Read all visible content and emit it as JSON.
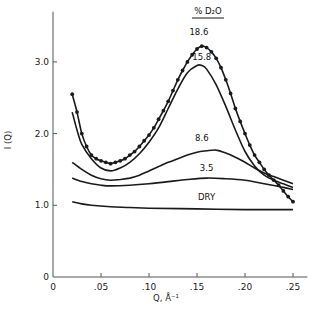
{
  "chart_data": {
    "type": "line",
    "title": "",
    "xlabel": "Q, Å⁻¹",
    "ylabel": "I (Q)",
    "xlim": [
      0,
      0.265
    ],
    "ylim": [
      0,
      3.7
    ],
    "grid": false,
    "legend": {
      "title": "% D2O",
      "position": "curve-labels"
    },
    "x_ticks": [
      {
        "value": 0,
        "label": "0"
      },
      {
        "value": 0.05,
        "label": ".05"
      },
      {
        "value": 0.1,
        "label": ".10"
      },
      {
        "value": 0.15,
        "label": ".15"
      },
      {
        "value": 0.2,
        "label": ".20"
      },
      {
        "value": 0.25,
        "label": ".25"
      }
    ],
    "y_ticks": [
      {
        "value": 0,
        "label": "0"
      },
      {
        "value": 1.0,
        "label": "1.0"
      },
      {
        "value": 2.0,
        "label": "2.0"
      },
      {
        "value": 3.0,
        "label": "3.0"
      }
    ],
    "series": [
      {
        "name": "18.6",
        "style": "line+markers",
        "label_pos": [
          0.152,
          3.38
        ],
        "points": [
          [
            0.02,
            2.55
          ],
          [
            0.025,
            2.3
          ],
          [
            0.03,
            2.0
          ],
          [
            0.035,
            1.82
          ],
          [
            0.04,
            1.7
          ],
          [
            0.045,
            1.65
          ],
          [
            0.05,
            1.62
          ],
          [
            0.055,
            1.6
          ],
          [
            0.06,
            1.58
          ],
          [
            0.065,
            1.6
          ],
          [
            0.07,
            1.62
          ],
          [
            0.075,
            1.65
          ],
          [
            0.08,
            1.7
          ],
          [
            0.085,
            1.75
          ],
          [
            0.09,
            1.82
          ],
          [
            0.095,
            1.9
          ],
          [
            0.1,
            1.98
          ],
          [
            0.105,
            2.08
          ],
          [
            0.11,
            2.2
          ],
          [
            0.115,
            2.32
          ],
          [
            0.12,
            2.45
          ],
          [
            0.125,
            2.6
          ],
          [
            0.13,
            2.75
          ],
          [
            0.135,
            2.88
          ],
          [
            0.14,
            3.0
          ],
          [
            0.145,
            3.1
          ],
          [
            0.15,
            3.18
          ],
          [
            0.155,
            3.22
          ],
          [
            0.16,
            3.2
          ],
          [
            0.165,
            3.14
          ],
          [
            0.17,
            3.05
          ],
          [
            0.175,
            2.92
          ],
          [
            0.18,
            2.75
          ],
          [
            0.185,
            2.56
          ],
          [
            0.19,
            2.35
          ],
          [
            0.195,
            2.17
          ],
          [
            0.2,
            2.0
          ],
          [
            0.205,
            1.84
          ],
          [
            0.21,
            1.7
          ],
          [
            0.215,
            1.6
          ],
          [
            0.22,
            1.5
          ],
          [
            0.225,
            1.42
          ],
          [
            0.23,
            1.35
          ],
          [
            0.235,
            1.28
          ],
          [
            0.24,
            1.2
          ],
          [
            0.245,
            1.12
          ],
          [
            0.25,
            1.05
          ]
        ]
      },
      {
        "name": "15.8",
        "style": "line",
        "label_pos": [
          0.155,
          3.03
        ],
        "points": [
          [
            0.02,
            2.3
          ],
          [
            0.025,
            2.05
          ],
          [
            0.03,
            1.85
          ],
          [
            0.04,
            1.65
          ],
          [
            0.05,
            1.52
          ],
          [
            0.06,
            1.48
          ],
          [
            0.07,
            1.52
          ],
          [
            0.08,
            1.6
          ],
          [
            0.09,
            1.72
          ],
          [
            0.1,
            1.88
          ],
          [
            0.11,
            2.08
          ],
          [
            0.12,
            2.35
          ],
          [
            0.13,
            2.62
          ],
          [
            0.14,
            2.85
          ],
          [
            0.15,
            2.95
          ],
          [
            0.155,
            2.95
          ],
          [
            0.16,
            2.9
          ],
          [
            0.17,
            2.68
          ],
          [
            0.18,
            2.38
          ],
          [
            0.19,
            2.05
          ],
          [
            0.2,
            1.75
          ],
          [
            0.21,
            1.55
          ],
          [
            0.22,
            1.42
          ],
          [
            0.23,
            1.35
          ],
          [
            0.24,
            1.3
          ],
          [
            0.25,
            1.25
          ]
        ]
      },
      {
        "name": "8.6",
        "style": "line",
        "label_pos": [
          0.155,
          1.9
        ],
        "points": [
          [
            0.02,
            1.6
          ],
          [
            0.03,
            1.5
          ],
          [
            0.04,
            1.42
          ],
          [
            0.05,
            1.37
          ],
          [
            0.06,
            1.35
          ],
          [
            0.07,
            1.36
          ],
          [
            0.08,
            1.38
          ],
          [
            0.09,
            1.42
          ],
          [
            0.1,
            1.48
          ],
          [
            0.11,
            1.54
          ],
          [
            0.12,
            1.6
          ],
          [
            0.13,
            1.65
          ],
          [
            0.14,
            1.7
          ],
          [
            0.15,
            1.74
          ],
          [
            0.16,
            1.76
          ],
          [
            0.17,
            1.77
          ],
          [
            0.18,
            1.73
          ],
          [
            0.19,
            1.67
          ],
          [
            0.2,
            1.6
          ],
          [
            0.21,
            1.52
          ],
          [
            0.22,
            1.45
          ],
          [
            0.23,
            1.4
          ],
          [
            0.24,
            1.35
          ],
          [
            0.25,
            1.3
          ]
        ]
      },
      {
        "name": "3.5",
        "style": "line",
        "label_pos": [
          0.16,
          1.48
        ],
        "points": [
          [
            0.02,
            1.38
          ],
          [
            0.03,
            1.33
          ],
          [
            0.04,
            1.3
          ],
          [
            0.05,
            1.28
          ],
          [
            0.06,
            1.27
          ],
          [
            0.08,
            1.28
          ],
          [
            0.1,
            1.3
          ],
          [
            0.12,
            1.33
          ],
          [
            0.14,
            1.36
          ],
          [
            0.16,
            1.38
          ],
          [
            0.18,
            1.37
          ],
          [
            0.2,
            1.35
          ],
          [
            0.22,
            1.3
          ],
          [
            0.24,
            1.25
          ],
          [
            0.25,
            1.22
          ]
        ]
      },
      {
        "name": "DRY",
        "style": "line",
        "label_pos": [
          0.16,
          1.08
        ],
        "points": [
          [
            0.02,
            1.05
          ],
          [
            0.03,
            1.02
          ],
          [
            0.04,
            1.0
          ],
          [
            0.06,
            0.98
          ],
          [
            0.08,
            0.97
          ],
          [
            0.1,
            0.96
          ],
          [
            0.15,
            0.95
          ],
          [
            0.2,
            0.94
          ],
          [
            0.25,
            0.94
          ]
        ]
      }
    ]
  },
  "legend_title": "% D₂O",
  "axes": {
    "xlabel": "Q, Å⁻¹",
    "ylabel": "I (Q)"
  },
  "colors": {
    "line": "#1a1a1a",
    "axis": "#555555",
    "background": "#ffffff"
  }
}
